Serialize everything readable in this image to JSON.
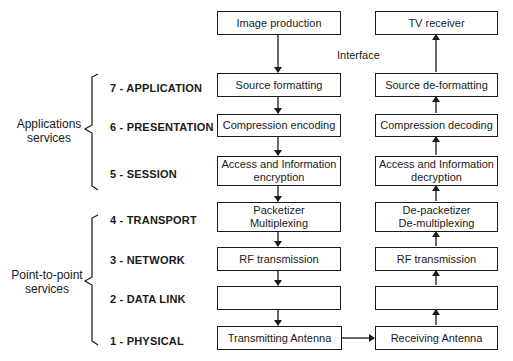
{
  "diagram": {
    "groups": [
      {
        "label_line1": "Applications",
        "label_line2": "services"
      },
      {
        "label_line1": "Point-to-point",
        "label_line2": "services"
      }
    ],
    "layers": [
      {
        "label": "7 - APPLICATION"
      },
      {
        "label": "6 - PRESENTATION"
      },
      {
        "label": "5 - SESSION"
      },
      {
        "label": "4 - TRANSPORT"
      },
      {
        "label": "3 - NETWORK"
      },
      {
        "label": "2 - DATA LINK"
      },
      {
        "label": "1 - PHYSICAL"
      }
    ],
    "interface_label": "Interface",
    "transmit_column": {
      "top": "Image production",
      "boxes": [
        {
          "line1": "Source formatting",
          "line2": ""
        },
        {
          "line1": "Compression encoding",
          "line2": ""
        },
        {
          "line1": "Access and Information",
          "line2": "encryption"
        },
        {
          "line1": "Packetizer",
          "line2": "Multiplexing"
        },
        {
          "line1": "RF transmission",
          "line2": ""
        },
        {
          "line1": "",
          "line2": ""
        },
        {
          "line1": "Transmitting Antenna",
          "line2": ""
        }
      ]
    },
    "receive_column": {
      "top": "TV receiver",
      "boxes": [
        {
          "line1": "Source de-formatting",
          "line2": ""
        },
        {
          "line1": "Compression decoding",
          "line2": ""
        },
        {
          "line1": "Access and Information",
          "line2": "decryption"
        },
        {
          "line1": "De-packetizer",
          "line2": "De-multiplexing"
        },
        {
          "line1": "RF transmission",
          "line2": ""
        },
        {
          "line1": "",
          "line2": ""
        },
        {
          "line1": "Receiving Antenna",
          "line2": ""
        }
      ]
    }
  }
}
